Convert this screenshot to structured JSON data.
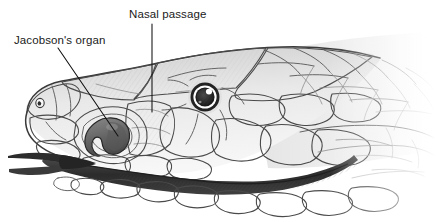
{
  "figure": {
    "style": "pencil-drawing-grayscale",
    "width": 436,
    "height": 222,
    "background_color": "#ffffff"
  },
  "labels": [
    {
      "id": "jacobsons-organ",
      "text": "Jacobson's organ",
      "text_x": 14,
      "text_y": 44,
      "leader_from_x": 58,
      "leader_from_y": 48,
      "leader_to_x": 118,
      "leader_to_y": 136,
      "color": "#1a1a1a"
    },
    {
      "id": "nasal-passage",
      "text": "Nasal passage",
      "text_x": 129,
      "text_y": 18,
      "leader_from_x": 152,
      "leader_from_y": 24,
      "leader_to_x": 152,
      "leader_to_y": 112,
      "color": "#1a1a1a"
    }
  ],
  "anatomy": {
    "eye": {
      "name": "eye",
      "cx": 205,
      "cy": 97,
      "iris_r": 15,
      "ring_r": 11.5,
      "pupil_r": 9,
      "highlight_cx": 209,
      "highlight_cy": 92,
      "highlight_r": 3,
      "pupil_color": "#2b2b2b",
      "ring_color": "#ffffff",
      "outer_color": "#1e1e1e",
      "highlight_color": "#ffffff"
    },
    "nostril": {
      "name": "nostril",
      "cx": 40,
      "cy": 103,
      "r": 3.2,
      "color": "#3a3a3a"
    },
    "jacobsons_organ": {
      "name": "jacobsons-organ-structure",
      "cx": 116,
      "cy": 137,
      "fill_color": "#6b6b6b",
      "outline_color": "#2a2a2a"
    },
    "nasal_passage_region": {
      "name": "nasal-passage-region",
      "cx": 152,
      "cy": 120,
      "fill_color": "#e8e8e8"
    },
    "tongue": {
      "name": "forked-tongue",
      "color": "#2a2a2a",
      "tip_x": 8,
      "tip_y": 158
    },
    "mouth_line": {
      "name": "mouth-line",
      "color": "#2e2e2e"
    }
  },
  "palette": {
    "ink": "#1a1a1a",
    "outline": "#4a4a4a",
    "scale_line": "#5e5e5e",
    "scale_line_faint": "#8e8e8e",
    "scale_fill_light": "#f2f2f2",
    "scale_fill_mid": "#e0e0e0",
    "scale_fill_dark": "#c8c8c8",
    "shadow": "#9a9a9a",
    "background": "#ffffff"
  }
}
